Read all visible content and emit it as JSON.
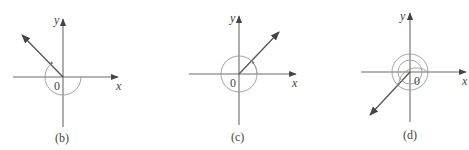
{
  "figures": [
    {
      "id": "b",
      "caption": "(b)",
      "x_label": "x",
      "y_label": "y",
      "origin_label": "0",
      "ray_direction": "second quadrant (upper-left)",
      "angle_description": "angle drawn counterclockwise from positive x-axis to terminal side in quadrant II, arc of about 3/4 turn shown going clockwise (negative angle)"
    },
    {
      "id": "c",
      "caption": "(c)",
      "x_label": "x",
      "y_label": "y",
      "origin_label": "0",
      "ray_direction": "first quadrant (upper-right)",
      "angle_description": "arc makes more than one full counterclockwise turn ending on terminal side in quadrant I"
    },
    {
      "id": "d",
      "caption": "(d)",
      "x_label": "x",
      "y_label": "y",
      "origin_label": "0",
      "ray_direction": "third quadrant (lower-left)",
      "angle_description": "arc makes multiple full turns (double loop) ending on terminal side in quadrant III"
    }
  ],
  "colors": {
    "axis": "#6b6b6b",
    "ray": "#555555",
    "arc": "#9a9a9a",
    "text": "#444444"
  }
}
